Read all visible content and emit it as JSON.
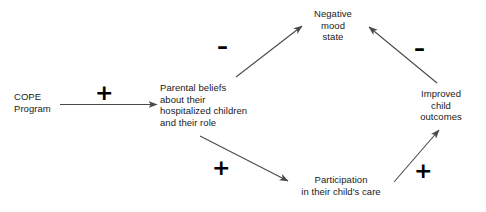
{
  "diagram": {
    "type": "causal-path-model",
    "background_color": "#ffffff",
    "text_color": "#1a1a1a",
    "line_color": "#4a4a4a",
    "nodes": [
      {
        "id": "cope",
        "label": "COPE\nProgram"
      },
      {
        "id": "beliefs",
        "label": "Parental beliefs\nabout their\nhospitalized children\nand their role"
      },
      {
        "id": "negative",
        "label": "Negative\nmood\nstate"
      },
      {
        "id": "improved",
        "label": "Improved\nchild\noutcomes"
      },
      {
        "id": "participation",
        "label": "Participation\nin their child's care"
      }
    ],
    "edges": [
      {
        "id": "cope-beliefs",
        "from": "cope",
        "to": "beliefs",
        "sign": "+"
      },
      {
        "id": "beliefs-negative",
        "from": "beliefs",
        "to": "negative",
        "sign": "–"
      },
      {
        "id": "beliefs-part",
        "from": "beliefs",
        "to": "participation",
        "sign": "+"
      },
      {
        "id": "part-improved",
        "from": "participation",
        "to": "improved",
        "sign": "+"
      },
      {
        "id": "improved-negative",
        "from": "improved",
        "to": "negative",
        "sign": "–"
      }
    ]
  }
}
